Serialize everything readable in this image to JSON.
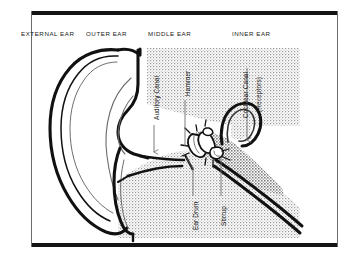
{
  "figure": {
    "background_color": "#ffffff",
    "frame_color": "#141414",
    "ink_color": "#111111",
    "tissue_fill": "#d8d8d8"
  },
  "regions": [
    {
      "id": "external-ear",
      "label": "EXTERNAL EAR",
      "x": 21,
      "y": 30
    },
    {
      "id": "outer-ear",
      "label": "OUTER EAR",
      "x": 86,
      "y": 30
    },
    {
      "id": "middle-ear",
      "label": "MIDDLE EAR",
      "x": 148,
      "y": 30
    },
    {
      "id": "inner-ear",
      "label": "INNER EAR",
      "x": 232,
      "y": 30
    }
  ],
  "callouts": [
    {
      "id": "auditory-canal",
      "label": "Auditory Canal",
      "orientation": "vertical",
      "text_x": 153,
      "text_y": 120,
      "leader": {
        "x": 154,
        "y1": 123,
        "y2": 158
      },
      "arrow": true
    },
    {
      "id": "hammer",
      "label": "Hammer",
      "orientation": "vertical",
      "text_x": 184,
      "text_y": 96,
      "leader": {
        "x": 185,
        "y1": 99,
        "y2": 148
      },
      "arrow": false
    },
    {
      "id": "cochlear-canal",
      "label": "Cochlear Canal",
      "orientation": "vertical",
      "text_x": 242,
      "text_y": 118,
      "leader": {
        "x": 247,
        "y1": 66,
        "y2": 146
      },
      "arrow": true
    },
    {
      "id": "cochlear-canal-receptors",
      "label": "(Receptors)",
      "orientation": "vertical",
      "text_x": 255,
      "text_y": 112,
      "leader": null,
      "arrow": false
    },
    {
      "id": "ear-drum",
      "label": "Ear Drum",
      "orientation": "vertical",
      "text_x": 192,
      "text_y": 230,
      "leader": {
        "x": 193,
        "y1": 164,
        "y2": 196
      },
      "arrow": false
    },
    {
      "id": "stirrup",
      "label": "Stirrup",
      "orientation": "vertical",
      "text_x": 220,
      "text_y": 226,
      "leader": {
        "x": 221,
        "y1": 158,
        "y2": 196
      },
      "arrow": false
    }
  ],
  "anatomy_parts": [
    {
      "id": "pinna",
      "name": "Pinna (auricle)"
    },
    {
      "id": "ear-canal",
      "name": "External auditory canal"
    },
    {
      "id": "tympanic",
      "name": "Tympanic membrane"
    },
    {
      "id": "ossicles",
      "name": "Ossicles"
    },
    {
      "id": "cochlea",
      "name": "Cochlea"
    },
    {
      "id": "eustachian",
      "name": "Eustachian tube"
    },
    {
      "id": "skull-tissue",
      "name": "Surrounding bone / tissue"
    }
  ]
}
